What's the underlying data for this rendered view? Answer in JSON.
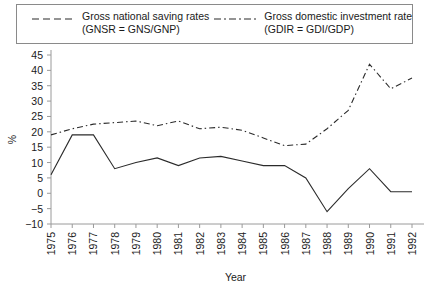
{
  "legend": {
    "entries": [
      {
        "name": "gnsr",
        "line1": "Gross national saving rates",
        "line2": "(GNSR = GNS/GNP)",
        "style": "dashed",
        "color": "#2b2b2b"
      },
      {
        "name": "gdir",
        "line1": "Gross domestic investment rate",
        "line2": "(GDIR = GDI/GDP)",
        "style": "dash-dot",
        "color": "#2b2b2b"
      }
    ]
  },
  "axes": {
    "ylabel": "%",
    "xlabel": "Year",
    "yticks": [
      "45",
      "40",
      "35",
      "30",
      "25",
      "20",
      "15",
      "10",
      "5",
      "0",
      "-5",
      "-10"
    ],
    "xticks": [
      "1975",
      "1976",
      "1977",
      "1978",
      "1979",
      "1980",
      "1981",
      "1982",
      "1983",
      "1984",
      "1985",
      "1986",
      "1987",
      "1988",
      "1989",
      "1990",
      "1991",
      "1992"
    ]
  },
  "chart_data": {
    "type": "line",
    "title": "",
    "xlabel": "Year",
    "ylabel": "%",
    "xlim": [
      1975,
      1992
    ],
    "ylim": [
      -10,
      45
    ],
    "grid": false,
    "legend_position": "top",
    "x": [
      1975,
      1976,
      1977,
      1978,
      1979,
      1980,
      1981,
      1982,
      1983,
      1984,
      1985,
      1986,
      1987,
      1988,
      1989,
      1990,
      1991,
      1992
    ],
    "series": [
      {
        "name": "Gross national saving rates (GNSR = GNS/GNP)",
        "short": "GNSR",
        "style": "dashed",
        "color": "#2b2b2b",
        "values": [
          6,
          19,
          19,
          8,
          10,
          11.5,
          9,
          11.5,
          12,
          10.5,
          9,
          9,
          5,
          -6,
          1.5,
          8,
          0.5,
          0.5
        ]
      },
      {
        "name": "Gross domestic investment rate (GDIR = GDI/GDP)",
        "short": "GDIR",
        "style": "dash-dot",
        "color": "#2b2b2b",
        "values": [
          19,
          21,
          22.5,
          23,
          23.5,
          22,
          23.5,
          21,
          21.5,
          20.5,
          18,
          15.5,
          16,
          16.5,
          22,
          24,
          24,
          25.5
        ]
      }
    ],
    "note": "GDIR continues rising after 1987: 1988 27, 1989 29, 1990 42, 1991 34.5, 1992 37.5"
  },
  "chart_points": {
    "gnsr": [
      6,
      19,
      19,
      8,
      10,
      11.5,
      9,
      11.5,
      12,
      10.5,
      9,
      9,
      5,
      -6,
      1.5,
      8,
      0.5,
      0.5
    ],
    "gdir": [
      19,
      21,
      22.5,
      23,
      23.5,
      22,
      23.5,
      21,
      21.5,
      20.5,
      18,
      15.5,
      16,
      21,
      27,
      42,
      34,
      37.5
    ]
  }
}
